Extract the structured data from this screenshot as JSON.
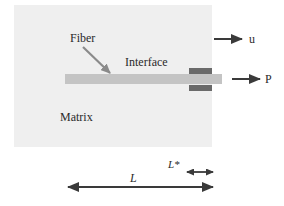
{
  "figure": {
    "labels": {
      "fiber": "Fiber",
      "interface": "Interface",
      "matrix": "Matrix",
      "displacement": "u",
      "load": "P",
      "embedded_length": "L",
      "debond_length": "L*"
    },
    "colors": {
      "matrix_fill": "#efefef",
      "fiber_fill": "#c4c4c4",
      "grip_fill": "#6a6a6a",
      "arrow": "#3a3a3a",
      "pointer_arrow": "#8a8a8a",
      "text": "#2a2a2a"
    }
  }
}
